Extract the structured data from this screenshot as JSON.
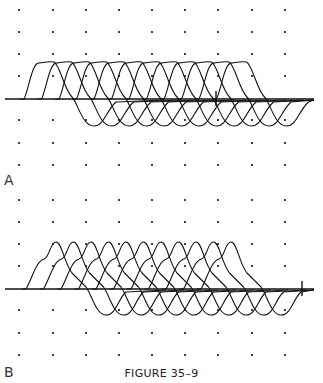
{
  "figure": {
    "caption": "FIGURE 35–9",
    "panels": [
      {
        "label": "A",
        "description": "Superimposed biphasic waveform traces over dot grid; symmetric positive/negative deflections"
      },
      {
        "label": "B",
        "description": "Superimposed biphasic waveform traces over dot grid; sharper peaked positive deflections"
      }
    ]
  },
  "chart_data": [
    {
      "type": "line",
      "title": "A",
      "grid": "dot grid 9 columns x 8 rows",
      "grid_x": [
        19,
        53,
        86,
        119,
        152,
        185,
        218,
        252,
        285
      ],
      "grid_rows_y": [
        10,
        32,
        54,
        76,
        120,
        143,
        165
      ],
      "baseline_y": 99,
      "trace_count": 12,
      "trace_spacing_px": 17.5,
      "first_trace_start_x": 24,
      "positive_amplitude_px": 38,
      "negative_amplitude_px": 27,
      "positive_shape": "plateau",
      "marker_x": 216
    },
    {
      "type": "line",
      "title": "B",
      "grid": "dot grid 9 columns x 8 rows",
      "grid_x": [
        19,
        53,
        86,
        119,
        152,
        185,
        218,
        252,
        285
      ],
      "grid_rows_y": [
        10,
        32,
        54,
        76,
        120,
        143,
        165
      ],
      "baseline_y": 99,
      "trace_count": 11,
      "trace_spacing_px": 17.5,
      "first_trace_start_x": 26,
      "positive_amplitude_px": 47,
      "negative_amplitude_px": 26,
      "positive_shape": "peaked",
      "marker_x": 302
    }
  ]
}
